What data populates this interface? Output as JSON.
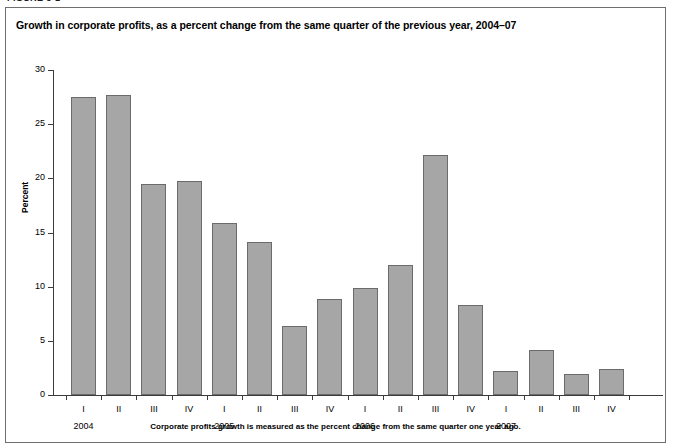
{
  "figure": {
    "label": "FIGURE 3-1"
  },
  "chart": {
    "title": "Growth in corporate profits, as a percent change from the same quarter of the previous year, 2004–07",
    "footnote": "Corporate profits growth is measured as the percent change from the same quarter one year ago.",
    "ylabel": "Percent",
    "bar_color": "#a6a6a6",
    "bar_border_color": "#6b6b6b",
    "axis_color": "#3b3b3b"
  },
  "chart_data": {
    "type": "bar",
    "title": "Growth in corporate profits, as a percent change from the same quarter of the previous year, 2004–07",
    "xlabel": "",
    "ylabel": "Percent",
    "ylim": [
      0,
      30
    ],
    "yticks": [
      0,
      5,
      10,
      15,
      20,
      25,
      30
    ],
    "ytick_labels": [
      "0",
      "5",
      "10",
      "15",
      "20",
      "25",
      "30"
    ],
    "grid": false,
    "legend": false,
    "categories": [
      "I",
      "II",
      "III",
      "IV",
      "I",
      "II",
      "III",
      "IV",
      "I",
      "II",
      "III",
      "IV",
      "I",
      "II",
      "III",
      "IV"
    ],
    "group_labels": [
      "2004",
      "2005",
      "2006",
      "2007"
    ],
    "values": [
      27.5,
      27.7,
      19.5,
      19.8,
      15.9,
      14.1,
      6.4,
      8.9,
      9.9,
      12.0,
      22.2,
      8.3,
      2.2,
      4.2,
      1.9,
      2.4
    ],
    "annotation": "Corporate profits growth is measured as the percent change from the same quarter one year ago."
  }
}
